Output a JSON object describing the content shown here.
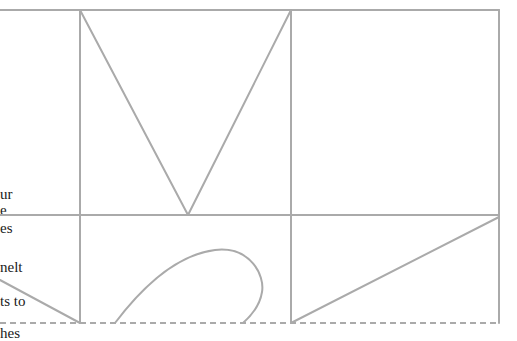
{
  "margin_text": [
    {
      "text": "ur",
      "y": 187
    },
    {
      "text": "e",
      "y": 203
    },
    {
      "text": "es",
      "y": 221
    },
    {
      "text": "nelt",
      "y": 260
    },
    {
      "text": "ts to",
      "y": 294
    },
    {
      "text": "hes",
      "y": 326
    }
  ],
  "figure": {
    "stroke_color": "#aaaaaa",
    "grid": {
      "columns_x": [
        80,
        291,
        499
      ],
      "rows_y": [
        10,
        215,
        323
      ],
      "bottom_style": "dashed"
    },
    "panels": [
      {
        "id": "top-middle",
        "shape": "v-shape",
        "description": "Lines from top corners converging at bottom center"
      },
      {
        "id": "top-right",
        "shape": "empty"
      },
      {
        "id": "bottom-left",
        "shape": "diagonal",
        "description": "Line descending to bottom-right corner"
      },
      {
        "id": "bottom-middle",
        "shape": "loop-curve",
        "description": "Closed-top loop curve rising from bottom"
      },
      {
        "id": "bottom-right",
        "shape": "diagonal",
        "description": "Line from bottom-left corner rising to top-right corner"
      }
    ]
  }
}
